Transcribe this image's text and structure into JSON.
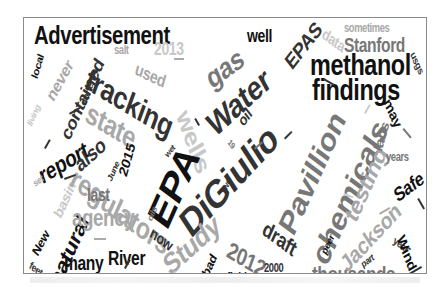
{
  "word_cloud": {
    "colors": {
      "black": "#111111",
      "dark": "#333333",
      "mid": "#777777",
      "light": "#a8a8a8",
      "pale": "#c8c8c8",
      "border": "#8a8a8a"
    },
    "words": [
      {
        "text": "Advertisement",
        "x": 10,
        "y": 4,
        "size": 26,
        "rot": 0,
        "color": "#111111"
      },
      {
        "text": "gas",
        "x": 178,
        "y": 50,
        "size": 30,
        "rot": -30,
        "color": "#777777"
      },
      {
        "text": "well",
        "x": 3,
        "y": 9,
        "size": 18,
        "rot": 0,
        "color": "#111111",
        "ox": 223
      },
      {
        "text": "EPAS",
        "x": 258,
        "y": 40,
        "size": 22,
        "rot": -45,
        "color": "#333333"
      },
      {
        "text": "data",
        "x": 302,
        "y": 8,
        "size": 16,
        "rot": 30,
        "color": "#c8c8c8"
      },
      {
        "text": "sometimes",
        "x": 320,
        "y": 4,
        "size": 12,
        "rot": 0,
        "color": "#a8a8a8"
      },
      {
        "text": "Stanford",
        "x": 320,
        "y": 17,
        "size": 20,
        "rot": 0,
        "color": "#777777"
      },
      {
        "text": "usgs",
        "x": 392,
        "y": 32,
        "size": 11,
        "rot": 60,
        "color": "#333333"
      },
      {
        "text": "methanol",
        "x": 286,
        "y": 32,
        "size": 30,
        "rot": 0,
        "color": "#111111"
      },
      {
        "text": "findings",
        "x": 288,
        "y": 57,
        "size": 30,
        "rot": 0,
        "color": "#111111"
      },
      {
        "text": "salt",
        "x": 90,
        "y": 26,
        "size": 12,
        "rot": 0,
        "color": "#a8a8a8"
      },
      {
        "text": "2013",
        "x": 130,
        "y": 22,
        "size": 18,
        "rot": 0,
        "color": "#c8c8c8"
      },
      {
        "text": "used",
        "x": 114,
        "y": 42,
        "size": 18,
        "rot": 20,
        "color": "#a8a8a8"
      },
      {
        "text": "local",
        "x": 6,
        "y": 58,
        "size": 12,
        "rot": -70,
        "color": "#111111"
      },
      {
        "text": "never",
        "x": 20,
        "y": 76,
        "size": 18,
        "rot": -55,
        "color": "#a8a8a8"
      },
      {
        "text": "contained",
        "x": 34,
        "y": 115,
        "size": 20,
        "rot": -60,
        "color": "#333333"
      },
      {
        "text": "fracking",
        "x": 68,
        "y": 45,
        "size": 32,
        "rot": 25,
        "color": "#333333"
      },
      {
        "text": "wells",
        "x": 168,
        "y": 88,
        "size": 28,
        "rot": 65,
        "color": "#c8c8c8"
      },
      {
        "text": "Water",
        "x": 178,
        "y": 96,
        "size": 34,
        "rot": -35,
        "color": "#333333"
      },
      {
        "text": "done",
        "x": 55,
        "y": 85,
        "size": 11,
        "rot": -65,
        "color": "#333333"
      },
      {
        "text": "living",
        "x": 2,
        "y": 105,
        "size": 10,
        "rot": -60,
        "color": "#c8c8c8"
      },
      {
        "text": "state",
        "x": 68,
        "y": 80,
        "size": 30,
        "rot": 25,
        "color": "#a8a8a8"
      },
      {
        "text": "oil",
        "x": 212,
        "y": 100,
        "size": 16,
        "rot": -45,
        "color": "#333333"
      },
      {
        "text": "report",
        "x": 12,
        "y": 148,
        "size": 24,
        "rot": -25,
        "color": "#111111"
      },
      {
        "text": "also",
        "x": 48,
        "y": 140,
        "size": 22,
        "rot": -35,
        "color": "#333333"
      },
      {
        "text": "June",
        "x": 82,
        "y": 160,
        "size": 10,
        "rot": -60,
        "color": "#333333"
      },
      {
        "text": "2015",
        "x": 93,
        "y": 155,
        "size": 16,
        "rot": -70,
        "color": "#111111"
      },
      {
        "text": "EPA",
        "x": 118,
        "y": 195,
        "size": 44,
        "rot": -60,
        "color": "#111111"
      },
      {
        "text": "DiGiulio",
        "x": 150,
        "y": 195,
        "size": 40,
        "rot": -40,
        "color": "#333333"
      },
      {
        "text": "19",
        "x": 207,
        "y": 120,
        "size": 9,
        "rot": 45,
        "color": "#777777"
      },
      {
        "text": "wet",
        "x": 140,
        "y": 135,
        "size": 9,
        "rot": -45,
        "color": "#333333"
      },
      {
        "text": "Pavillion",
        "x": 250,
        "y": 205,
        "size": 34,
        "rot": -60,
        "color": "#777777"
      },
      {
        "text": "chemicals",
        "x": 283,
        "y": 235,
        "size": 34,
        "rot": -60,
        "color": "#777777"
      },
      {
        "text": "testing",
        "x": 317,
        "y": 195,
        "size": 26,
        "rot": -60,
        "color": "#a8a8a8"
      },
      {
        "text": "labs",
        "x": 348,
        "y": 130,
        "size": 16,
        "rot": -70,
        "color": "#777777"
      },
      {
        "text": "may",
        "x": 368,
        "y": 78,
        "size": 16,
        "rot": 60,
        "color": "#111111"
      },
      {
        "text": "years",
        "x": 362,
        "y": 133,
        "size": 12,
        "rot": 0,
        "color": "#777777"
      },
      {
        "text": "basin",
        "x": 28,
        "y": 195,
        "size": 16,
        "rot": -60,
        "color": "#c8c8c8"
      },
      {
        "text": "set",
        "x": 8,
        "y": 162,
        "size": 10,
        "rot": -30,
        "color": "#a8a8a8"
      },
      {
        "text": "regulators",
        "x": 54,
        "y": 145,
        "size": 30,
        "rot": 30,
        "color": "#a8a8a8"
      },
      {
        "text": "Study",
        "x": 135,
        "y": 238,
        "size": 30,
        "rot": -35,
        "color": "#a8a8a8"
      },
      {
        "text": "two",
        "x": 196,
        "y": 172,
        "size": 10,
        "rot": -60,
        "color": "#333333"
      },
      {
        "text": "oils",
        "x": 122,
        "y": 200,
        "size": 10,
        "rot": -60,
        "color": "#777777"
      },
      {
        "text": "Safe",
        "x": 367,
        "y": 170,
        "size": 20,
        "rot": -30,
        "color": "#111111"
      },
      {
        "text": "New",
        "x": 6,
        "y": 232,
        "size": 14,
        "rot": -55,
        "color": "#111111"
      },
      {
        "text": "natural",
        "x": 22,
        "y": 260,
        "size": 24,
        "rot": -60,
        "color": "#111111"
      },
      {
        "text": "last",
        "x": 63,
        "y": 168,
        "size": 18,
        "rot": 0,
        "color": "#777777"
      },
      {
        "text": "agency",
        "x": 48,
        "y": 188,
        "size": 24,
        "rot": 0,
        "color": "#a8a8a8"
      },
      {
        "text": "now",
        "x": 130,
        "y": 207,
        "size": 16,
        "rot": 30,
        "color": "#333333"
      },
      {
        "text": "draft",
        "x": 244,
        "y": 200,
        "size": 22,
        "rot": 30,
        "color": "#333333"
      },
      {
        "text": "2012",
        "x": 208,
        "y": 220,
        "size": 24,
        "rot": 25,
        "color": "#777777"
      },
      {
        "text": "peer",
        "x": 296,
        "y": 233,
        "size": 11,
        "rot": -60,
        "color": "#111111"
      },
      {
        "text": "Jackson",
        "x": 313,
        "y": 240,
        "size": 24,
        "rot": -40,
        "color": "#a8a8a8"
      },
      {
        "text": "year",
        "x": 372,
        "y": 217,
        "size": 11,
        "rot": 30,
        "color": "#333333"
      },
      {
        "text": "Wind",
        "x": 382,
        "y": 215,
        "size": 16,
        "rot": 65,
        "color": "#111111"
      },
      {
        "text": "part",
        "x": 336,
        "y": 243,
        "size": 10,
        "rot": -30,
        "color": "#333333"
      },
      {
        "text": "feet",
        "x": 8,
        "y": 242,
        "size": 11,
        "rot": 30,
        "color": "#333333"
      },
      {
        "text": "many",
        "x": 40,
        "y": 235,
        "size": 20,
        "rot": 0,
        "color": "#111111"
      },
      {
        "text": "River",
        "x": 84,
        "y": 230,
        "size": 20,
        "rot": 0,
        "color": "#111111"
      },
      {
        "text": "agencies",
        "x": 86,
        "y": 256,
        "size": 13,
        "rot": 0,
        "color": "#c8c8c8"
      },
      {
        "text": "toxic",
        "x": 135,
        "y": 263,
        "size": 11,
        "rot": -35,
        "color": "#c8c8c8"
      },
      {
        "text": "bad",
        "x": 176,
        "y": 254,
        "size": 14,
        "rot": -60,
        "color": "#111111"
      },
      {
        "text": "fluid",
        "x": 203,
        "y": 252,
        "size": 13,
        "rot": 0,
        "color": "#111111"
      },
      {
        "text": "2000",
        "x": 240,
        "y": 244,
        "size": 12,
        "rot": 0,
        "color": "#333333"
      },
      {
        "text": "thousands",
        "x": 288,
        "y": 246,
        "size": 22,
        "rot": 0,
        "color": "#777777"
      }
    ]
  },
  "caption": ""
}
